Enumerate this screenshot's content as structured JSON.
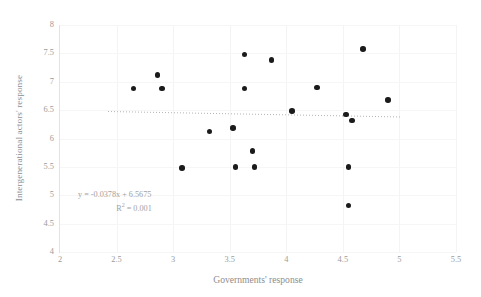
{
  "chart_data": {
    "type": "scatter",
    "title": "",
    "xlabel": "Governments' response",
    "ylabel": "Intergenerational actors' response",
    "xlim": [
      2,
      5.5
    ],
    "ylim": [
      4,
      8
    ],
    "xticks": [
      "2",
      "2.5",
      "3",
      "3.5",
      "4",
      "4.5",
      "5",
      "5.5"
    ],
    "xtick_values": [
      2,
      2.5,
      3,
      3.5,
      4,
      4.5,
      5,
      5.5
    ],
    "yticks": [
      "8",
      "7.5",
      "7",
      "6.5",
      "6",
      "5.5",
      "5",
      "4.5",
      "4"
    ],
    "ytick_values": [
      8,
      7.5,
      7,
      6.5,
      6,
      5.5,
      5,
      4.5,
      4
    ],
    "grid": true,
    "legend": null,
    "marker_color": "#1b1b1b",
    "trendline_color": "#b4b4b4",
    "points": [
      {
        "x": 2.65,
        "y": 6.88
      },
      {
        "x": 2.86,
        "y": 7.12
      },
      {
        "x": 2.9,
        "y": 6.88
      },
      {
        "x": 3.08,
        "y": 5.48
      },
      {
        "x": 3.32,
        "y": 6.12
      },
      {
        "x": 3.53,
        "y": 6.18
      },
      {
        "x": 3.55,
        "y": 5.5
      },
      {
        "x": 3.63,
        "y": 7.48
      },
      {
        "x": 3.63,
        "y": 6.88
      },
      {
        "x": 3.7,
        "y": 5.78
      },
      {
        "x": 3.72,
        "y": 5.5
      },
      {
        "x": 3.87,
        "y": 7.38
      },
      {
        "x": 4.05,
        "y": 6.48
      },
      {
        "x": 4.27,
        "y": 6.9
      },
      {
        "x": 4.53,
        "y": 6.42
      },
      {
        "x": 4.55,
        "y": 5.5
      },
      {
        "x": 4.55,
        "y": 4.82
      },
      {
        "x": 4.58,
        "y": 6.32
      },
      {
        "x": 4.68,
        "y": 7.58
      },
      {
        "x": 4.9,
        "y": 6.68
      }
    ],
    "trendline": {
      "slope": -0.0378,
      "intercept": 6.5675,
      "x_start": 2.42,
      "x_end": 5.02,
      "equation_label": "y = -0.0378x + 6.5675",
      "r_squared_label": "R² = 0.001",
      "r_squared_value": 0.001
    }
  },
  "annotations": {
    "equation_prefix": "y = -0.0378x + 6.5675",
    "r_label": "R",
    "r_exponent": "2",
    "r_value": " = 0.001"
  }
}
